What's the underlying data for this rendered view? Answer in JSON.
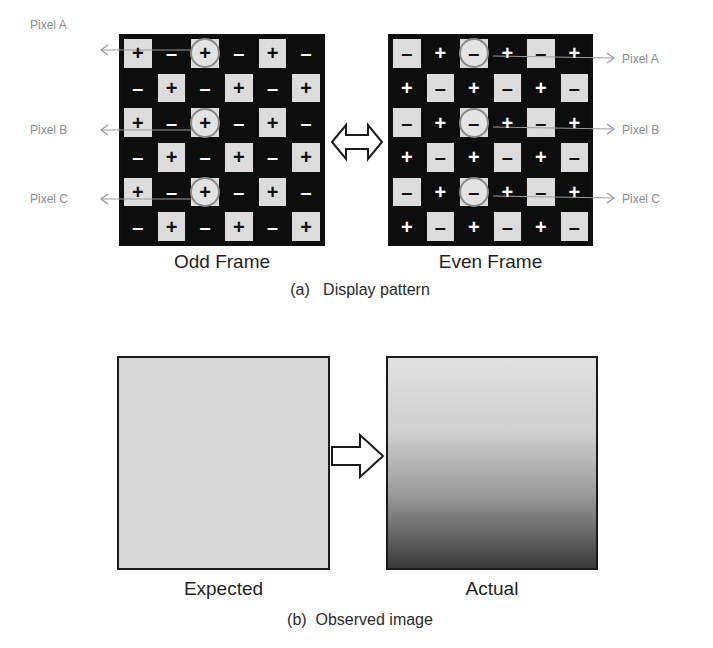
{
  "section_a": {
    "caption": "(a)   Display pattern",
    "odd_frame": {
      "label": "Odd Frame",
      "light_symbol": "+",
      "dark_symbol": "-",
      "rows": [
        [
          "+",
          "-",
          "+",
          "-",
          "+",
          "-"
        ],
        [
          "-",
          "+",
          "-",
          "+",
          "-",
          "+"
        ],
        [
          "+",
          "-",
          "+",
          "-",
          "+",
          "-"
        ],
        [
          "-",
          "+",
          "-",
          "+",
          "-",
          "+"
        ],
        [
          "+",
          "-",
          "+",
          "-",
          "+",
          "-"
        ],
        [
          "-",
          "+",
          "-",
          "+",
          "-",
          "+"
        ]
      ]
    },
    "even_frame": {
      "label": "Even Frame",
      "light_symbol": "-",
      "dark_symbol": "+",
      "rows": [
        [
          "-",
          "+",
          "-",
          "+",
          "-",
          "+"
        ],
        [
          "+",
          "-",
          "+",
          "-",
          "+",
          "-"
        ],
        [
          "-",
          "+",
          "-",
          "+",
          "-",
          "+"
        ],
        [
          "+",
          "-",
          "+",
          "-",
          "+",
          "-"
        ],
        [
          "-",
          "+",
          "-",
          "+",
          "-",
          "+"
        ],
        [
          "+",
          "-",
          "+",
          "-",
          "+",
          "-"
        ]
      ]
    },
    "highlighted_pixels": [
      {
        "label": "Pixel A",
        "row": 0,
        "col": 2
      },
      {
        "label": "Pixel B",
        "row": 2,
        "col": 2
      },
      {
        "label": "Pixel C",
        "row": 4,
        "col": 2
      }
    ],
    "between_icon": "double-arrow-icon"
  },
  "section_b": {
    "caption": "(b)  Observed image",
    "expected": {
      "label": "Expected",
      "color": "#d9d9d9"
    },
    "actual": {
      "label": "Actual",
      "gradient_top": "#e0e0e0",
      "gradient_bottom": "#3a3a3a"
    },
    "between_icon": "right-arrow-icon"
  },
  "colors": {
    "cell_light": "#dcdcdc",
    "cell_dark": "#0d0d0d",
    "label_gray": "#8a8a8a",
    "circle_ring": "#8a8a8a"
  }
}
